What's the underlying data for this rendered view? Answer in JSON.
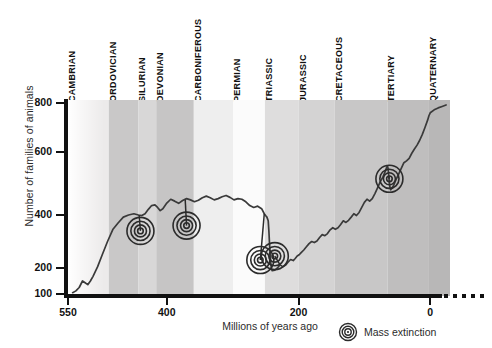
{
  "chart_data": {
    "type": "line",
    "title": "",
    "xlabel": "Millions of years ago",
    "ylabel": "Number of families of animals",
    "xlim": [
      550,
      -30
    ],
    "ylim": [
      100,
      860
    ],
    "x_ticks": [
      550,
      400,
      200,
      0
    ],
    "x_tick_labels": [
      "550",
      "400",
      "200",
      "0"
    ],
    "y_ticks": [
      100,
      200,
      400,
      600,
      800
    ],
    "y_tick_labels": [
      "100",
      "200",
      "400",
      "600",
      "800"
    ],
    "grid": false,
    "legend_position": "bottom-right",
    "legend": [
      {
        "label": "Mass extinction",
        "marker": "concentric-rings"
      }
    ],
    "series": [
      {
        "name": "Number of families of animals",
        "color": "#3a3a3a",
        "points": [
          [
            543,
            105
          ],
          [
            538,
            112
          ],
          [
            533,
            125
          ],
          [
            528,
            150
          ],
          [
            524,
            143
          ],
          [
            520,
            136
          ],
          [
            516,
            150
          ],
          [
            512,
            168
          ],
          [
            505,
            205
          ],
          [
            498,
            250
          ],
          [
            490,
            300
          ],
          [
            482,
            345
          ],
          [
            474,
            370
          ],
          [
            466,
            392
          ],
          [
            458,
            400
          ],
          [
            450,
            404
          ],
          [
            443,
            400
          ],
          [
            438,
            398
          ],
          [
            433,
            404
          ],
          [
            428,
            418
          ],
          [
            423,
            430
          ],
          [
            418,
            432
          ],
          [
            414,
            424
          ],
          [
            410,
            414
          ],
          [
            406,
            420
          ],
          [
            400,
            438
          ],
          [
            394,
            450
          ],
          [
            388,
            444
          ],
          [
            382,
            437
          ],
          [
            376,
            446
          ],
          [
            370,
            452
          ],
          [
            364,
            448
          ],
          [
            358,
            442
          ],
          [
            352,
            447
          ],
          [
            346,
            455
          ],
          [
            340,
            460
          ],
          [
            334,
            455
          ],
          [
            328,
            448
          ],
          [
            322,
            452
          ],
          [
            316,
            458
          ],
          [
            310,
            462
          ],
          [
            304,
            456
          ],
          [
            298,
            448
          ],
          [
            292,
            452
          ],
          [
            286,
            450
          ],
          [
            280,
            442
          ],
          [
            274,
            430
          ],
          [
            268,
            424
          ],
          [
            262,
            428
          ],
          [
            256,
            420
          ],
          [
            252,
            404
          ],
          [
            250,
            398
          ],
          [
            248,
            392
          ],
          [
            246,
            378
          ],
          [
            245,
            340
          ],
          [
            244,
            290
          ],
          [
            243,
            250
          ],
          [
            242,
            215
          ],
          [
            241,
            196
          ],
          [
            240,
            190
          ],
          [
            236,
            192
          ],
          [
            232,
            200
          ],
          [
            228,
            212
          ],
          [
            224,
            205
          ],
          [
            220,
            210
          ],
          [
            216,
            222
          ],
          [
            212,
            232
          ],
          [
            208,
            228
          ],
          [
            205,
            236
          ],
          [
            202,
            245
          ],
          [
            199,
            250
          ],
          [
            196,
            258
          ],
          [
            192,
            268
          ],
          [
            188,
            280
          ],
          [
            184,
            292
          ],
          [
            180,
            300
          ],
          [
            176,
            296
          ],
          [
            172,
            302
          ],
          [
            168,
            315
          ],
          [
            164,
            326
          ],
          [
            160,
            322
          ],
          [
            156,
            330
          ],
          [
            152,
            344
          ],
          [
            148,
            352
          ],
          [
            144,
            346
          ],
          [
            140,
            352
          ],
          [
            136,
            364
          ],
          [
            132,
            378
          ],
          [
            128,
            372
          ],
          [
            124,
            380
          ],
          [
            120,
            392
          ],
          [
            116,
            404
          ],
          [
            112,
            398
          ],
          [
            108,
            408
          ],
          [
            104,
            424
          ],
          [
            100,
            440
          ],
          [
            96,
            450
          ],
          [
            92,
            444
          ],
          [
            88,
            452
          ],
          [
            84,
            468
          ],
          [
            80,
            486
          ],
          [
            76,
            505
          ],
          [
            72,
            520
          ],
          [
            68,
            540
          ],
          [
            66,
            552
          ],
          [
            65,
            556
          ],
          [
            64,
            548
          ],
          [
            63,
            524
          ],
          [
            62,
            500
          ],
          [
            61,
            486
          ],
          [
            60,
            480
          ],
          [
            56,
            492
          ],
          [
            52,
            512
          ],
          [
            48,
            530
          ],
          [
            44,
            548
          ],
          [
            40,
            566
          ],
          [
            36,
            572
          ],
          [
            32,
            580
          ],
          [
            28,
            596
          ],
          [
            24,
            612
          ],
          [
            20,
            628
          ],
          [
            16,
            648
          ],
          [
            12,
            672
          ],
          [
            8,
            700
          ],
          [
            4,
            730
          ],
          [
            2,
            748
          ],
          [
            0,
            760
          ],
          [
            -6,
            772
          ],
          [
            -12,
            780
          ],
          [
            -18,
            786
          ],
          [
            -24,
            792
          ]
        ]
      }
    ],
    "mass_extinctions": [
      {
        "name": "End Ordovician",
        "x": 440,
        "y": 340,
        "anchor_x": 442,
        "anchor_y": 400
      },
      {
        "name": "Late Devonian",
        "x": 370,
        "y": 360,
        "anchor_x": 372,
        "anchor_y": 448
      },
      {
        "name": "End Permian",
        "x": 258,
        "y": 230,
        "anchor_x": 252,
        "anchor_y": 404
      },
      {
        "name": "End Triassic",
        "x": 236,
        "y": 245,
        "anchor_x": 228,
        "anchor_y": 212
      },
      {
        "name": "End Cretaceous",
        "x": 62,
        "y": 515,
        "anchor_x": 63,
        "anchor_y": 524
      }
    ],
    "geologic_periods": [
      {
        "label": "CAMBRIAN",
        "start": 550,
        "end": 488,
        "shade": "#eceaea"
      },
      {
        "label": "ORDOVICIAN",
        "start": 488,
        "end": 443,
        "shade": "#c9c8c8"
      },
      {
        "label": "SILURIAN",
        "start": 443,
        "end": 416,
        "shade": "#d8d7d7"
      },
      {
        "label": "DEVONIAN",
        "start": 416,
        "end": 359,
        "shade": "#c6c5c5"
      },
      {
        "label": "CARBONIFEROUS",
        "start": 359,
        "end": 299,
        "shade": "#eeeeee"
      },
      {
        "label": "PERMIAN",
        "start": 299,
        "end": 251,
        "shade": "#fbfbfb"
      },
      {
        "label": "TRIASSIC",
        "start": 251,
        "end": 200,
        "shade": "#dedddd"
      },
      {
        "label": "JURASSIC",
        "start": 200,
        "end": 145,
        "shade": "#d4d3d3"
      },
      {
        "label": "CRETACEOUS",
        "start": 145,
        "end": 65,
        "shade": "#c8c7c7"
      },
      {
        "label": "TERTIARY",
        "start": 65,
        "end": 2,
        "shade": "#bfbebe"
      },
      {
        "label": "QUATERNARY",
        "start": 2,
        "end": -30,
        "shade": "#b8b7b7"
      }
    ]
  }
}
